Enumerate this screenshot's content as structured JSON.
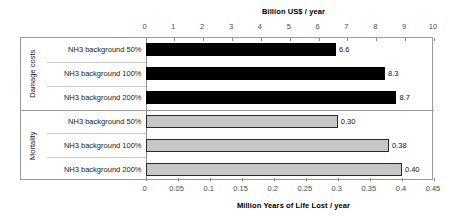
{
  "chart_data": {
    "type": "bar",
    "orientation": "horizontal",
    "title": "",
    "grid": false,
    "legend": "none",
    "top_axis": {
      "label": "Billion US$ / year",
      "position": "top",
      "min": 0,
      "max": 10,
      "step": 1,
      "ticks": [
        "0",
        "1",
        "2",
        "3",
        "4",
        "5",
        "6",
        "7",
        "8",
        "9",
        "10"
      ]
    },
    "bottom_axis": {
      "label": "Million Years of Life Lost / year",
      "position": "bottom",
      "min": 0,
      "max": 0.45,
      "step": 0.05,
      "ticks": [
        "0",
        "0.05",
        "0.1",
        "0.15",
        "0.2",
        "0.25",
        "0.3",
        "0.35",
        "0.4",
        "0.45"
      ]
    },
    "groups": [
      {
        "name": "Damage costs",
        "axis": "top",
        "color": "#000000",
        "categories": [
          "NH3 background 50%",
          "NH3 background 100%",
          "NH3 background 200%"
        ],
        "values": [
          6.6,
          8.3,
          8.7
        ],
        "value_labels": [
          "6.6",
          "8.3",
          "8.7"
        ]
      },
      {
        "name": "Mortality",
        "axis": "bottom",
        "color": "#c6c6c6",
        "categories": [
          "NH3 background 50%",
          "NH3 background 100%",
          "NH3 background 200%"
        ],
        "values": [
          0.3,
          0.38,
          0.4
        ],
        "value_labels": [
          "0.30",
          "0.38",
          "0.40"
        ]
      }
    ]
  },
  "figure": {
    "top_axis_title": "Billion US$ / year",
    "bottom_axis_title": "Million Years of Life Lost / year",
    "group_damage_label": "Damage costs",
    "group_mortality_label": "Mortality",
    "rows": [
      {
        "label": "NH3 background 50%",
        "value_label": "6.6",
        "group": "Damage costs"
      },
      {
        "label": "NH3 background 100%",
        "value_label": "8.3",
        "group": "Damage costs"
      },
      {
        "label": "NH3 background 200%",
        "value_label": "8.7",
        "group": "Damage costs"
      },
      {
        "label": "NH3 background 50%",
        "value_label": "0.30",
        "group": "Mortality"
      },
      {
        "label": "NH3 background 100%",
        "value_label": "0.38",
        "group": "Mortality"
      },
      {
        "label": "NH3 background 200%",
        "value_label": "0.40",
        "group": "Mortality"
      }
    ],
    "colors": {
      "bar_damage": "#000000",
      "bar_mortality": "#c6c6c6",
      "frame": "#9b9b9b",
      "tick_text": "#4a4a4a"
    }
  }
}
